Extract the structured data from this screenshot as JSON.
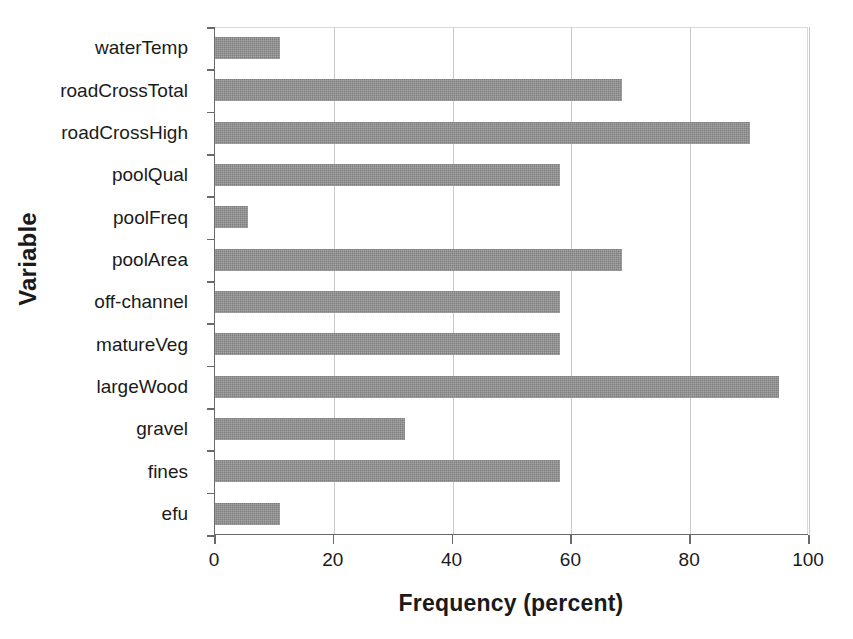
{
  "chart_data": {
    "type": "bar",
    "orientation": "horizontal",
    "title": "",
    "xlabel": "Frequency (percent)",
    "ylabel": "Variable",
    "xlim": [
      0,
      100
    ],
    "xticks": [
      0,
      20,
      40,
      60,
      80,
      100
    ],
    "xtick_labels": [
      "0",
      "20",
      "40",
      "60",
      "80",
      "100"
    ],
    "grid": "vertical",
    "legend": "none",
    "bar_color": "#7e7e7e",
    "axis_color": "#6a6a6a",
    "gridline_color": "#c9c9c9",
    "categories": [
      "waterTemp",
      "roadCrossTotal",
      "roadCrossHigh",
      "poolQual",
      "poolFreq",
      "poolArea",
      "off-channel",
      "matureVeg",
      "largeWood",
      "gravel",
      "fines",
      "efu"
    ],
    "values": [
      11,
      68.5,
      90,
      58,
      5.5,
      68.5,
      58,
      58,
      95,
      32,
      58,
      11
    ],
    "series": [
      {
        "name": "Frequency (percent)",
        "values": [
          11,
          68.5,
          90,
          58,
          5.5,
          68.5,
          58,
          58,
          95,
          32,
          58,
          11
        ]
      }
    ]
  }
}
